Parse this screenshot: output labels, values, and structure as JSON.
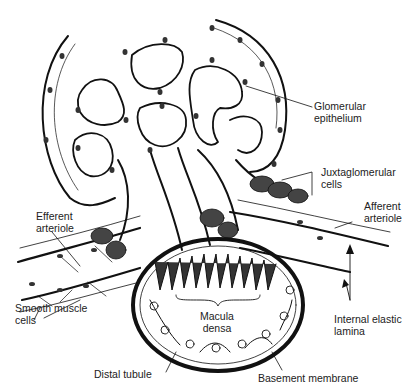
{
  "figure": {
    "labels": {
      "glomerular_epithelium": "Glomerular\nepithelium",
      "juxtaglomerular_cells": "Juxtaglomerular\ncells",
      "afferent_arteriole": "Afferent\narteriole",
      "efferent_arteriole": "Efferent\narteriole",
      "smooth_muscle_cells": "Smooth muscle\ncells",
      "internal_elastic_lamina": "Internal elastic\nlamina",
      "macula_densa": "Macula\ndensa",
      "distal_tubule": "Distal tubule",
      "basement_membrane": "Basement membrane"
    }
  }
}
